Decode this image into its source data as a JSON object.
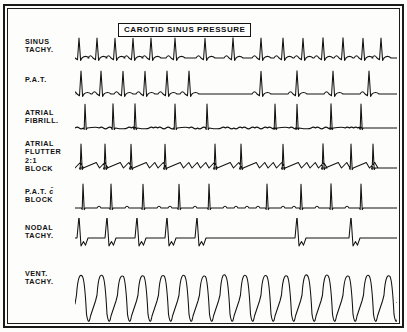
{
  "figure": {
    "title_box": "CAROTID SINUS PRESSURE",
    "frame_color": "#1a1a1a",
    "trace_color": "#121212",
    "background": "#fdfdfb"
  },
  "strips": [
    {
      "id": "sinus-tachy",
      "label_lines": [
        "SINUS",
        "TACHY."
      ],
      "top": 30,
      "height": 34,
      "trace_top": 26,
      "baseline": 24,
      "rhythm": "sinus tachycardia",
      "response": "gradual slowing then resumption",
      "waveform": {
        "kind": "pqrst",
        "amplitude": 20,
        "p_amp": 4.5,
        "t_amp": 3.2,
        "beats": [
          {
            "x": 4,
            "type": "pqrst"
          },
          {
            "x": 22,
            "type": "pqrst"
          },
          {
            "x": 40,
            "type": "pqrst"
          },
          {
            "x": 58,
            "type": "pqrst"
          },
          {
            "x": 76,
            "type": "pqrst"
          },
          {
            "x": 100,
            "type": "pqrst"
          },
          {
            "x": 130,
            "type": "pqrst"
          },
          {
            "x": 158,
            "type": "pqrst"
          },
          {
            "x": 186,
            "type": "pqrst"
          },
          {
            "x": 208,
            "type": "pqrst"
          },
          {
            "x": 228,
            "type": "pqrst"
          },
          {
            "x": 248,
            "type": "pqrst"
          },
          {
            "x": 268,
            "type": "pqrst"
          },
          {
            "x": 288,
            "type": "pqrst"
          },
          {
            "x": 306,
            "type": "pqrst"
          }
        ],
        "width": 322
      }
    },
    {
      "id": "pat",
      "label_lines": [
        "P.A.T."
      ],
      "top": 68,
      "height": 30,
      "trace_top": 60,
      "baseline": 26,
      "rhythm": "paroxysmal atrial tachycardia",
      "response": "abrupt conversion to sinus rhythm",
      "waveform": {
        "kind": "pqrst",
        "amplitude": 23,
        "p_amp": 4.5,
        "t_amp": 3.0,
        "beats": [
          {
            "x": 6,
            "type": "pqrst"
          },
          {
            "x": 26,
            "type": "pqrst"
          },
          {
            "x": 48,
            "type": "pqrst"
          },
          {
            "x": 70,
            "type": "pqrst"
          },
          {
            "x": 92,
            "type": "pqrst"
          },
          {
            "x": 114,
            "type": "pqrst"
          },
          {
            "x": 186,
            "type": "pqrst"
          },
          {
            "x": 222,
            "type": "pqrst"
          },
          {
            "x": 258,
            "type": "pqrst"
          },
          {
            "x": 294,
            "type": "pqrst"
          }
        ],
        "width": 322
      }
    },
    {
      "id": "atrial-fibrill",
      "label_lines": [
        "ATRIAL",
        "FIBRILL."
      ],
      "top": 101,
      "height": 34,
      "trace_top": 92,
      "baseline": 28,
      "rhythm": "atrial fibrillation",
      "response": "irregular slowing, no conversion",
      "waveform": {
        "kind": "fibrillation",
        "amplitude": 24,
        "fib_amp": 1.7,
        "fib_period": 4.2,
        "beats": [
          {
            "x": 10,
            "type": "qrs"
          },
          {
            "x": 38,
            "type": "qrs"
          },
          {
            "x": 60,
            "type": "qrs"
          },
          {
            "x": 100,
            "type": "qrs"
          },
          {
            "x": 132,
            "type": "qrs"
          },
          {
            "x": 200,
            "type": "qrs"
          },
          {
            "x": 222,
            "type": "qrs"
          },
          {
            "x": 256,
            "type": "qrs"
          },
          {
            "x": 286,
            "type": "qrs"
          }
        ],
        "width": 322
      }
    },
    {
      "id": "atrial-flutter",
      "label_lines": [
        "ATRIAL",
        "FLUTTER",
        "2:1",
        "BLOCK"
      ],
      "top": 132,
      "height": 40,
      "trace_top": 130,
      "baseline": 30,
      "rhythm": "atrial flutter with 2:1 block",
      "response": "increased block, sawtooth flutter waves revealed",
      "waveform": {
        "kind": "flutter",
        "amplitude": 24,
        "flutter_amp": 5.5,
        "flutter_period": 8.5,
        "beats": [
          {
            "x": 6,
            "type": "qrs"
          },
          {
            "x": 30,
            "type": "qrs"
          },
          {
            "x": 56,
            "type": "qrs"
          },
          {
            "x": 90,
            "type": "qrs"
          },
          {
            "x": 140,
            "type": "qrs"
          },
          {
            "x": 166,
            "type": "qrs"
          },
          {
            "x": 208,
            "type": "qrs"
          },
          {
            "x": 248,
            "type": "qrs"
          },
          {
            "x": 276,
            "type": "qrs"
          },
          {
            "x": 298,
            "type": "qrs"
          }
        ],
        "width": 322
      }
    },
    {
      "id": "pat-block",
      "label_lines": [
        "P.A.T. c̄",
        "BLOCK"
      ],
      "top": 180,
      "height": 34,
      "trace_top": 172,
      "baseline": 28,
      "rhythm": "P.A.T. with block",
      "response": "transient increase in block",
      "waveform": {
        "kind": "patblock",
        "amplitude": 24,
        "p_amp": 3.4,
        "p_spacing": 11,
        "beats": [
          {
            "x": 8,
            "type": "qrs"
          },
          {
            "x": 36,
            "type": "qrs"
          },
          {
            "x": 68,
            "type": "qrs"
          },
          {
            "x": 104,
            "type": "qrs"
          },
          {
            "x": 134,
            "type": "qrs"
          },
          {
            "x": 192,
            "type": "qrs"
          },
          {
            "x": 226,
            "type": "qrs"
          },
          {
            "x": 256,
            "type": "qrs"
          },
          {
            "x": 286,
            "type": "qrs"
          }
        ],
        "width": 322
      }
    },
    {
      "id": "nodal-tachy",
      "label_lines": [
        "NODAL",
        "TACHY."
      ],
      "top": 216,
      "height": 36,
      "trace_top": 210,
      "baseline": 20,
      "rhythm": "nodal (junctional) tachycardia",
      "response": "abrupt termination with long pause",
      "waveform": {
        "kind": "nodal",
        "amplitude": 22,
        "s_amp": 8,
        "beats": [
          {
            "x": 4,
            "type": "nodal"
          },
          {
            "x": 32,
            "type": "nodal"
          },
          {
            "x": 62,
            "type": "nodal"
          },
          {
            "x": 92,
            "type": "nodal"
          },
          {
            "x": 122,
            "type": "nodal"
          },
          {
            "x": 222,
            "type": "nodal"
          },
          {
            "x": 276,
            "type": "nodal"
          }
        ],
        "width": 322
      }
    },
    {
      "id": "vent-tachy",
      "label_lines": [
        "VENT.",
        "TACHY."
      ],
      "top": 262,
      "height": 52,
      "trace_top": 252,
      "baseline": 44,
      "rhythm": "ventricular tachycardia",
      "response": "no effect",
      "waveform": {
        "kind": "vtach",
        "amplitude": 30,
        "period": 20.5,
        "count": 16,
        "width": 322
      }
    }
  ]
}
